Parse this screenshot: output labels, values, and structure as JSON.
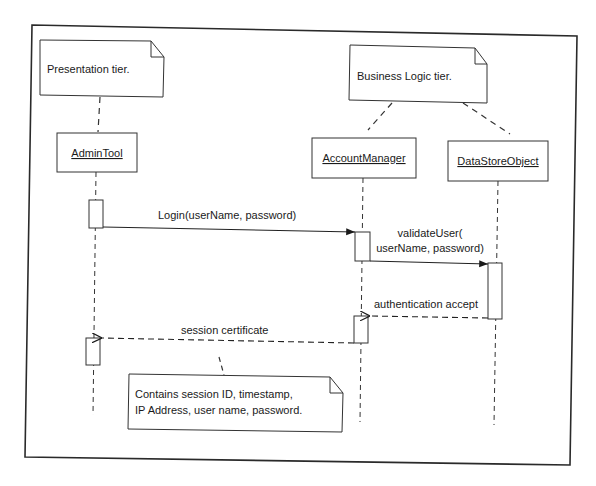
{
  "diagram": {
    "type": "uml-sequence",
    "notes": {
      "presentation": "Presentation tier.",
      "business": "Business Logic tier.",
      "certificate_line1": "Contains session ID, timestamp,",
      "certificate_line2": "IP Address, user name, password."
    },
    "lifelines": [
      {
        "name": "AdminTool"
      },
      {
        "name": "AccountManager"
      },
      {
        "name": "DataStoreObject"
      }
    ],
    "messages": [
      {
        "label": "Login(userName, password)",
        "from": "AdminTool",
        "to": "AccountManager",
        "kind": "synchronous"
      },
      {
        "label_line1": "validateUser(",
        "label_line2": "userName, password)",
        "from": "AccountManager",
        "to": "DataStoreObject",
        "kind": "synchronous"
      },
      {
        "label": "authentication accept",
        "from": "DataStoreObject",
        "to": "AccountManager",
        "kind": "return"
      },
      {
        "label": "session certificate",
        "from": "AccountManager",
        "to": "AdminTool",
        "kind": "return"
      }
    ],
    "colors": {
      "line": "#2a2a2a",
      "background": "#ffffff"
    }
  }
}
